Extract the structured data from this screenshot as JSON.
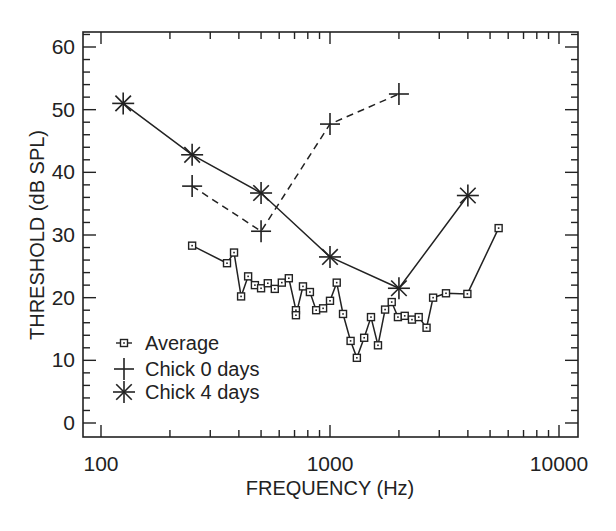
{
  "chart_data": {
    "type": "line",
    "title": "",
    "xlabel": "FREQUENCY (Hz)",
    "ylabel": "THRESHOLD (dB SPL)",
    "xscale": "log",
    "xlim": [
      78,
      12000
    ],
    "ylim": [
      -2.5,
      62.5
    ],
    "xticks": [
      100,
      1000,
      10000
    ],
    "xtick_labels": [
      "100",
      "1000",
      "10000"
    ],
    "yticks": [
      0,
      10,
      20,
      30,
      40,
      50,
      60
    ],
    "ytick_labels": [
      "0",
      "10",
      "20",
      "30",
      "40",
      "50",
      "60"
    ],
    "grid": false,
    "legend_position": "lower left",
    "series": [
      {
        "name": "Average",
        "marker": "square",
        "linestyle": "solid",
        "x": [
          250,
          355,
          381,
          409,
          439,
          470,
          500,
          535,
          574,
          616,
          661,
          710,
          710,
          762,
          817,
          870,
          933,
          1000,
          1070,
          1140,
          1230,
          1310,
          1410,
          1510,
          1620,
          1740,
          1860,
          1980,
          2120,
          2280,
          2440,
          2640,
          2820,
          3210,
          3980,
          5450
        ],
        "y": [
          28.3,
          25.5,
          27.2,
          20.2,
          23.4,
          22.0,
          21.5,
          22.3,
          21.4,
          22.4,
          23.1,
          18.0,
          17.2,
          21.8,
          20.9,
          18.0,
          18.3,
          19.5,
          22.4,
          17.4,
          13.1,
          10.4,
          13.6,
          16.9,
          12.4,
          18.1,
          19.3,
          16.9,
          17.1,
          16.5,
          16.9,
          15.2,
          20.0,
          20.7,
          20.6,
          31.1
        ]
      },
      {
        "name": "Chick 0 days",
        "marker": "plus",
        "linestyle": "dashed",
        "x": [
          250,
          500,
          1000,
          2000
        ],
        "y": [
          37.8,
          30.6,
          47.7,
          52.5
        ]
      },
      {
        "name": "Chick 4 days",
        "marker": "asterisk",
        "linestyle": "solid",
        "x": [
          125,
          250,
          500,
          1000,
          2000,
          4000
        ],
        "y": [
          51.0,
          42.8,
          36.7,
          26.5,
          21.5,
          36.3
        ]
      }
    ]
  },
  "legend": {
    "items": [
      {
        "label": "Average",
        "marker": "square-icon"
      },
      {
        "label": "Chick 0 days",
        "marker": "plus-icon"
      },
      {
        "label": "Chick 4 days",
        "marker": "asterisk-icon"
      }
    ]
  },
  "axes": {
    "x_label": "FREQUENCY (Hz)",
    "y_label": "THRESHOLD (dB SPL)"
  },
  "style": {
    "ink_color": "#222222",
    "background": "#ffffff"
  }
}
